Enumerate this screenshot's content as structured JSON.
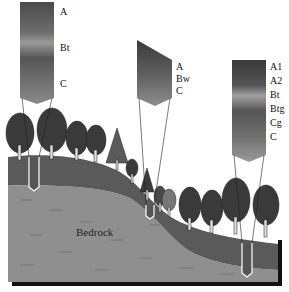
{
  "diagram": {
    "title": "",
    "colors": {
      "bedrock": "#8f8f8f",
      "soil": "#5a5a5a",
      "shadow": "#111111",
      "tree": "#3a3a3a",
      "profile_dark": "#3c3c3c",
      "profile_light": "#9a9a9a"
    },
    "profiles": [
      {
        "id": "upland",
        "position": "hilltop (left)",
        "horizons": [
          "A",
          "Bt",
          "C"
        ]
      },
      {
        "id": "slope",
        "position": "mid-slope (center)",
        "horizons": [
          "A",
          "Bw",
          "C"
        ]
      },
      {
        "id": "lowland",
        "position": "toeslope (right)",
        "horizons": [
          "A1",
          "A2",
          "Bt",
          "Btg",
          "Cg",
          "C"
        ]
      }
    ],
    "bedrock_label": "Bedrock"
  }
}
